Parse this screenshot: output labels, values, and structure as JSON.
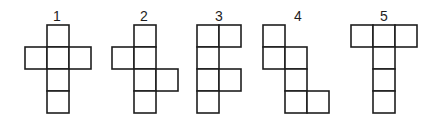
{
  "diagram": {
    "cell_size": 22,
    "stroke_color": "#1e1e1e",
    "figures": [
      {
        "label": "1",
        "origin": [
          25,
          25
        ],
        "cells": [
          [
            1,
            0
          ],
          [
            0,
            1
          ],
          [
            1,
            1
          ],
          [
            2,
            1
          ],
          [
            1,
            2
          ],
          [
            1,
            3
          ]
        ]
      },
      {
        "label": "2",
        "origin": [
          112,
          25
        ],
        "cells": [
          [
            1,
            0
          ],
          [
            0,
            1
          ],
          [
            1,
            1
          ],
          [
            1,
            2
          ],
          [
            2,
            2
          ],
          [
            1,
            3
          ]
        ]
      },
      {
        "label": "3",
        "origin": [
          197,
          25
        ],
        "cells": [
          [
            0,
            0
          ],
          [
            1,
            0
          ],
          [
            0,
            1
          ],
          [
            0,
            2
          ],
          [
            1,
            2
          ],
          [
            0,
            3
          ]
        ]
      },
      {
        "label": "4",
        "origin": [
          263,
          25
        ],
        "cells": [
          [
            0,
            0
          ],
          [
            0,
            1
          ],
          [
            1,
            1
          ],
          [
            1,
            2
          ],
          [
            1,
            3
          ],
          [
            2,
            3
          ]
        ]
      },
      {
        "label": "5",
        "origin": [
          351,
          25
        ],
        "cells": [
          [
            0,
            0
          ],
          [
            1,
            0
          ],
          [
            2,
            0
          ],
          [
            1,
            1
          ],
          [
            1,
            2
          ],
          [
            1,
            3
          ]
        ]
      }
    ]
  }
}
